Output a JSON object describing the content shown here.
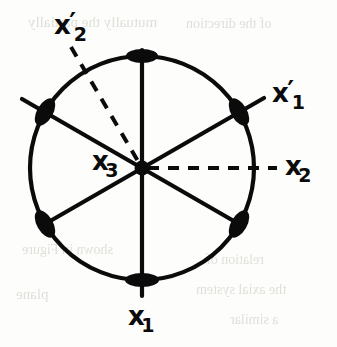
{
  "figure": {
    "background_color": "#fdfdfb",
    "ink_color": "#0b0b0b",
    "ghost_color": "#c9c6bd"
  },
  "geometry": {
    "center": {
      "x": 142,
      "y": 168
    },
    "radius": 112,
    "vertex_count": 6,
    "vertex_angles_deg": [
      90,
      30,
      -30,
      -90,
      -150,
      150
    ],
    "vertices": [
      {
        "name": "vertex-top",
        "x": 142,
        "y": 56,
        "angle_deg": 90
      },
      {
        "name": "vertex-upper-right",
        "x": 239,
        "y": 112,
        "angle_deg": 30
      },
      {
        "name": "vertex-lower-right",
        "x": 239,
        "y": 224,
        "angle_deg": -30
      },
      {
        "name": "vertex-bottom",
        "x": 142,
        "y": 280,
        "angle_deg": -90
      },
      {
        "name": "vertex-lower-left",
        "x": 45,
        "y": 224,
        "angle_deg": -150
      },
      {
        "name": "vertex-upper-left",
        "x": 45,
        "y": 112,
        "angle_deg": 150
      }
    ],
    "solid_diameters": [
      {
        "name": "diameter-vertical",
        "from": "vertex-top",
        "to": "vertex-bottom"
      },
      {
        "name": "diameter-upper-right",
        "from": "vertex-upper-right",
        "to": "vertex-lower-left"
      },
      {
        "name": "diameter-upper-left",
        "from": "vertex-upper-left",
        "to": "vertex-lower-right"
      }
    ],
    "dashed_axes": [
      {
        "name": "dashed-axis-x2prime",
        "angle_deg": 135,
        "label": "x'2"
      },
      {
        "name": "dashed-axis-x2",
        "angle_deg": 0,
        "label": "x2"
      }
    ]
  },
  "labels": [
    {
      "id": "x2prime",
      "base": "x",
      "prime": "′",
      "sub": "2",
      "x": 54,
      "y": 12,
      "name": "label-x2-prime"
    },
    {
      "id": "x1prime",
      "base": "x",
      "prime": "′",
      "sub": "1",
      "x": 272,
      "y": 80,
      "name": "label-x1-prime"
    },
    {
      "id": "x2",
      "base": "x",
      "prime": "",
      "sub": "2",
      "x": 285,
      "y": 153,
      "name": "label-x2"
    },
    {
      "id": "x3",
      "base": "x",
      "prime": "",
      "sub": "3",
      "x": 92,
      "y": 148,
      "name": "label-x3"
    },
    {
      "id": "x1",
      "base": "x",
      "prime": "",
      "sub": "1",
      "x": 128,
      "y": 303,
      "name": "label-x1"
    }
  ],
  "ghost_text": [
    {
      "text": "mutually  the partially",
      "x": 28,
      "y": 14,
      "size": 15
    },
    {
      "text": "of  the  direction",
      "x": 186,
      "y": 16,
      "size": 14
    },
    {
      "text": "shown in  Figure",
      "x": 22,
      "y": 242,
      "size": 14
    },
    {
      "text": "relation  of",
      "x": 206,
      "y": 252,
      "size": 14
    },
    {
      "text": "plane",
      "x": 16,
      "y": 286,
      "size": 15
    },
    {
      "text": "the  axial  system",
      "x": 196,
      "y": 282,
      "size": 14
    },
    {
      "text": "a  similar",
      "x": 230,
      "y": 312,
      "size": 14
    }
  ]
}
